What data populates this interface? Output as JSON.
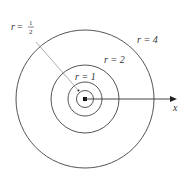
{
  "diagram": {
    "center": {
      "x": 85,
      "y": 99
    },
    "circles": [
      {
        "label": "r = 1/2",
        "r_value": "1/2",
        "radius_px": 8.5
      },
      {
        "label": "r = 1",
        "r_value": "1",
        "radius_px": 17
      },
      {
        "label": "r = 2",
        "r_value": "2",
        "radius_px": 34
      },
      {
        "label": "r = 4",
        "r_value": "4",
        "radius_px": 69
      }
    ],
    "labels": {
      "r_half_var": "r",
      "r_half_eq": "=",
      "r_half_num": "1",
      "r_half_den": "2",
      "r1": "r = 1",
      "r2": "r = 2",
      "r4": "r = 4",
      "axis": "x"
    },
    "colors": {
      "line": "#555555",
      "leader": "#888888",
      "text": "#333333"
    }
  }
}
